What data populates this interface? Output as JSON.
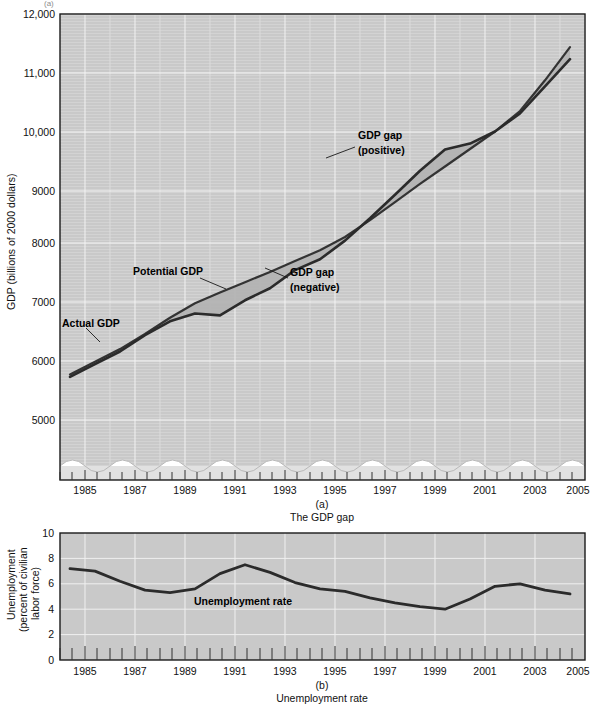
{
  "figure": {
    "top_cropped_fragment": "(a)",
    "panels": [
      {
        "letter": "(a)",
        "caption": "The GDP gap"
      },
      {
        "letter": "(b)",
        "caption": "Unemployment rate"
      }
    ]
  },
  "panel_a": {
    "y_axis_title_line1": "GDP (billions of 2000 dollars)",
    "y_ticks": [
      "5000",
      "6000",
      "7000",
      "8000",
      "9000",
      "10,000",
      "11,000",
      "12,000"
    ],
    "x_ticks": [
      "1985",
      "1987",
      "1989",
      "1991",
      "1993",
      "1995",
      "1997",
      "1999",
      "2001",
      "2003",
      "2005"
    ],
    "annotations": [
      {
        "name": "potential-gdp",
        "text": "Potential GDP"
      },
      {
        "name": "actual-gdp",
        "text": "Actual GDP"
      },
      {
        "name": "gdp-gap-negative-line1",
        "text": "GDP gap"
      },
      {
        "name": "gdp-gap-negative-line2",
        "text": "(negative)"
      },
      {
        "name": "gdp-gap-positive-line1",
        "text": "GDP gap"
      },
      {
        "name": "gdp-gap-positive-line2",
        "text": "(positive)"
      }
    ]
  },
  "panel_b": {
    "y_axis_title_line1": "Unemployment",
    "y_axis_title_line2": "(percent of civilian",
    "y_axis_title_line3": "labor force)",
    "y_ticks": [
      "0",
      "2",
      "4",
      "6",
      "8",
      "10"
    ],
    "x_ticks": [
      "1985",
      "1987",
      "1989",
      "1991",
      "1993",
      "1995",
      "1997",
      "1999",
      "2001",
      "2003",
      "2005"
    ],
    "annotations": [
      {
        "name": "unemployment-rate",
        "text": "Unemployment rate"
      }
    ]
  },
  "colors": {
    "plot_background": "#c9c9c9",
    "gridline": "#f0f0f0",
    "line_dark": "#2b2b2b",
    "gap_fill": "#b4b4b4",
    "axis": "#1a1a1a",
    "page_background": "#ffffff"
  },
  "chart_data": [
    {
      "type": "line",
      "title": "The GDP gap",
      "xlabel": "",
      "ylabel": "GDP (billions of 2000 dollars)",
      "xlim": [
        1984.6,
        2005.6
      ],
      "ylim": [
        4500,
        12000
      ],
      "grid": true,
      "legend": "inline-annotations",
      "axis_break": "y-axis broken below 4500",
      "x": [
        1985,
        1986,
        1987,
        1988,
        1989,
        1990,
        1991,
        1992,
        1993,
        1994,
        1995,
        1996,
        1997,
        1998,
        1999,
        2000,
        2001,
        2002,
        2003,
        2004,
        2005
      ],
      "series": [
        {
          "name": "Actual GDP",
          "values": [
            5980,
            6190,
            6400,
            6670,
            6900,
            7030,
            7000,
            7250,
            7450,
            7750,
            7930,
            8240,
            8610,
            9000,
            9400,
            9750,
            9850,
            10050,
            10350,
            10800,
            11250
          ]
        },
        {
          "name": "Potential GDP",
          "values": [
            6020,
            6230,
            6440,
            6690,
            6960,
            7200,
            7380,
            7550,
            7720,
            7900,
            8080,
            8300,
            8580,
            8880,
            9180,
            9470,
            9760,
            10050,
            10390,
            10900,
            11450
          ]
        }
      ],
      "annotations": [
        {
          "text": "Potential GDP",
          "x": 1989.0,
          "y": 7450
        },
        {
          "text": "Actual GDP",
          "x": 1986.4,
          "y": 6080
        },
        {
          "text": "GDP gap (negative)",
          "x": 1992.0,
          "y": 7450
        },
        {
          "text": "GDP gap (positive)",
          "x": 1998.6,
          "y": 10050
        }
      ]
    },
    {
      "type": "line",
      "title": "Unemployment rate",
      "xlabel": "",
      "ylabel": "Unemployment (percent of civilian labor force)",
      "xlim": [
        1984.6,
        2005.6
      ],
      "ylim": [
        0,
        10
      ],
      "grid": true,
      "legend": "inline-annotations",
      "x": [
        1985,
        1986,
        1987,
        1988,
        1989,
        1990,
        1991,
        1992,
        1993,
        1994,
        1995,
        1996,
        1997,
        1998,
        1999,
        2000,
        2001,
        2002,
        2003,
        2004,
        2005
      ],
      "series": [
        {
          "name": "Unemployment rate",
          "values": [
            7.2,
            7.0,
            6.2,
            5.5,
            5.3,
            5.6,
            6.8,
            7.5,
            6.9,
            6.1,
            5.6,
            5.4,
            4.9,
            4.5,
            4.2,
            4.0,
            4.8,
            5.8,
            6.0,
            5.5,
            5.2
          ]
        }
      ],
      "annotations": [
        {
          "text": "Unemployment rate",
          "x": 1991.5,
          "y": 4.4
        }
      ]
    }
  ]
}
